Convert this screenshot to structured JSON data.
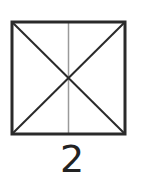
{
  "diagram": {
    "label": "2",
    "square": {
      "x": 12,
      "y": 22,
      "size": 113,
      "stroke": "#2a2a2a"
    },
    "center_line": {
      "stroke": "#9a9a9a"
    },
    "diagonals": {
      "stroke": "#2a2a2a"
    }
  }
}
